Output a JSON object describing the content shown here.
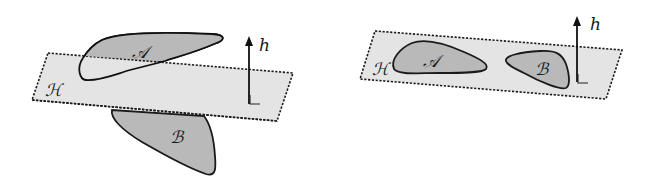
{
  "diagram": {
    "panels": [
      {
        "id": "left",
        "description": "Hyperplane H separating sets A and B on opposite sides",
        "plane_label": "ℋ",
        "set_a_label": "𝒜",
        "set_b_label": "ℬ",
        "normal_label": "h"
      },
      {
        "id": "right",
        "description": "Sets A and B both lying within hyperplane H",
        "plane_label": "ℋ",
        "set_a_label": "𝒜",
        "set_b_label": "ℬ",
        "normal_label": "h"
      }
    ],
    "colors": {
      "plane_fill": "#e4e4e4",
      "blob_fill": "#b9b9b9",
      "stroke": "#1a1a1a",
      "background": "#ffffff"
    }
  }
}
